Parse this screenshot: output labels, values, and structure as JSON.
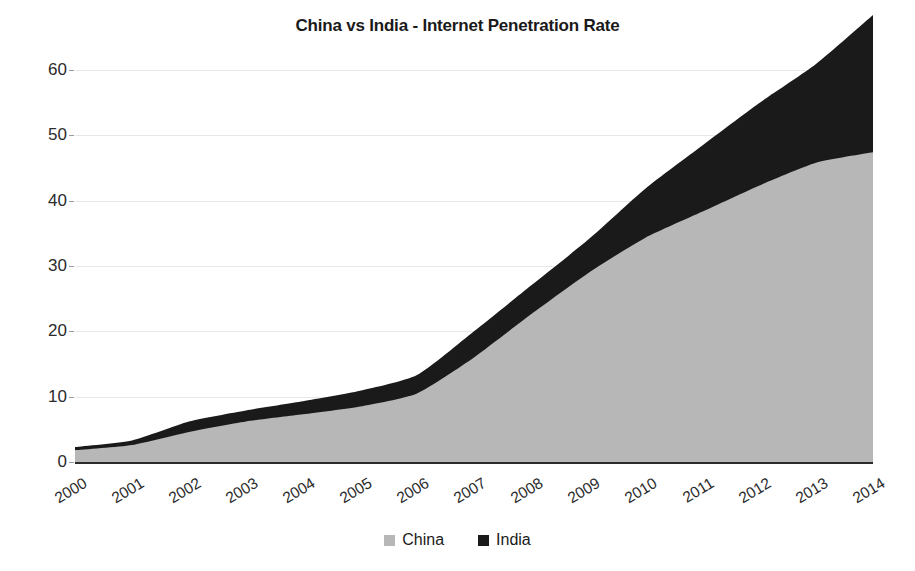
{
  "chart_data": {
    "type": "area",
    "stacked": true,
    "title": "China vs India - Internet Penetration Rate",
    "xlabel": "",
    "ylabel": "",
    "categories": [
      "2000",
      "2001",
      "2002",
      "2003",
      "2004",
      "2005",
      "2006",
      "2007",
      "2008",
      "2009",
      "2010",
      "2011",
      "2012",
      "2013",
      "2014"
    ],
    "x": [
      2000,
      2001,
      2002,
      2003,
      2004,
      2005,
      2006,
      2007,
      2008,
      2009,
      2010,
      2011,
      2012,
      2013,
      2014
    ],
    "ylim": [
      0,
      60
    ],
    "yticks": [
      0,
      10,
      20,
      30,
      40,
      50,
      60
    ],
    "grid": true,
    "legend_position": "bottom",
    "series": [
      {
        "name": "China",
        "color": "#b7b7b7",
        "values": [
          1.8,
          2.6,
          4.6,
          6.2,
          7.3,
          8.5,
          10.5,
          16.0,
          22.6,
          28.9,
          34.3,
          38.3,
          42.3,
          45.8,
          47.4
        ]
      },
      {
        "name": "India",
        "color": "#1a1a1a",
        "values": [
          0.5,
          0.7,
          1.6,
          1.7,
          2.0,
          2.4,
          2.8,
          4.0,
          4.4,
          5.1,
          7.5,
          10.1,
          12.6,
          15.1,
          21.0
        ]
      }
    ],
    "annotations": []
  },
  "legend": {
    "items": [
      {
        "label": "China",
        "color": "#b7b7b7"
      },
      {
        "label": "India",
        "color": "#1a1a1a"
      }
    ]
  },
  "axes": {
    "y_tick_labels": [
      "0",
      "10",
      "20",
      "30",
      "40",
      "50",
      "60"
    ],
    "x_tick_labels": [
      "2000",
      "2001",
      "2002",
      "2003",
      "2004",
      "2005",
      "2006",
      "2007",
      "2008",
      "2009",
      "2010",
      "2011",
      "2012",
      "2013",
      "2014"
    ]
  }
}
